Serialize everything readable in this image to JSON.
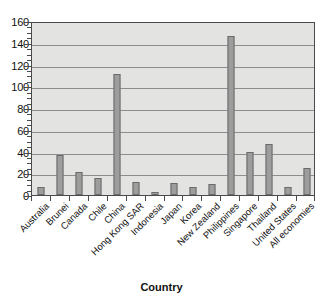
{
  "chart_data": {
    "type": "bar",
    "title": "",
    "subtitle": "",
    "xlabel": "Country",
    "ylabel": "",
    "ylim": [
      0,
      160
    ],
    "ytick_step": 20,
    "yticks": [
      0,
      20,
      40,
      60,
      80,
      100,
      120,
      140,
      160
    ],
    "ytick_labels": [
      "0",
      "20",
      "40",
      "60",
      "80",
      "100",
      "120",
      "140",
      "160"
    ],
    "grid": true,
    "grid_axis": "y",
    "legend": false,
    "legend_position": "none",
    "xtick_rotation": -45,
    "categories": [
      "Australia",
      "Brunei",
      "Canada",
      "Chile",
      "China",
      "Hong Kong SAR",
      "Indonesia",
      "Japan",
      "Korea",
      "New Zealand",
      "Philippines",
      "Singapore",
      "Thailand",
      "United States",
      "All economies"
    ],
    "values": [
      7,
      37,
      21,
      16,
      111,
      12,
      3,
      11,
      7,
      10,
      146,
      40,
      47,
      7,
      25
    ],
    "colors": {
      "bar_fill": "#9d9d9d",
      "bar_border": "#6a6a6a",
      "plot_background": "#e3e3e1",
      "gridline": "#8e8e8e",
      "axis": "#4a4a4a",
      "text": "#111111",
      "page_background": "#ffffff"
    }
  }
}
